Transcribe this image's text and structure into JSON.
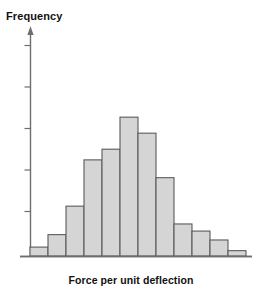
{
  "chart_data": {
    "type": "bar",
    "title": "",
    "subtitle": "",
    "xlabel": "Force per unit deflection",
    "ylabel": "Frequency",
    "grid": false,
    "legend": null,
    "bar_fill_color": "#d5d5d5",
    "bar_border_color": "#5a5a5a",
    "axis_color": "#6e6e6e",
    "y_axis": {
      "tick_count": 5,
      "tick_labels": [],
      "axis_has_arrow": true,
      "ylim": [
        0,
        10
      ]
    },
    "x_axis": {
      "tick_labels": [],
      "bin_count": 12
    },
    "categories": [
      "1",
      "2",
      "3",
      "4",
      "5",
      "6",
      "7",
      "8",
      "9",
      "10",
      "11",
      "12"
    ],
    "values": [
      0.5,
      1.2,
      2.8,
      5.4,
      6.0,
      7.8,
      6.9,
      4.4,
      1.8,
      1.4,
      0.9,
      0.3
    ],
    "annotations": []
  },
  "labels": {
    "y_axis_title": "Frequency",
    "x_axis_title": "Force per unit deflection"
  },
  "icons": {
    "axis_arrow": "arrow-up-icon"
  }
}
